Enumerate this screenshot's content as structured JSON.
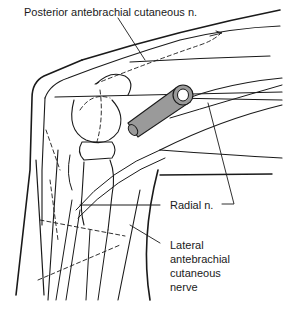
{
  "figure": {
    "labels": {
      "posterior_antebrachial": "Posterior antebrachial cutaneous n.",
      "radial": "Radial n.",
      "lateral_antebrachial_line1": "Lateral",
      "lateral_antebrachial_line2": "antebrachial",
      "lateral_antebrachial_line3": "cutaneous",
      "lateral_antebrachial_line4": "nerve"
    },
    "colors": {
      "line": "#1a1a1a",
      "cannula_fill": "#9a9a9a",
      "background": "#ffffff"
    }
  }
}
